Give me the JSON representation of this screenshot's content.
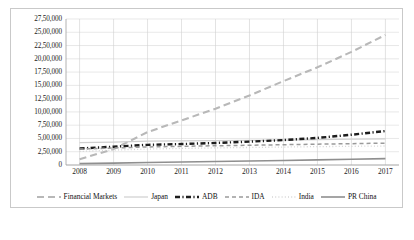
{
  "chart_data": {
    "type": "line",
    "title": "",
    "xlabel": "",
    "ylabel": "",
    "x": [
      2008,
      2009,
      2010,
      2011,
      2012,
      2013,
      2014,
      2015,
      2016,
      2017
    ],
    "xtick_labels": [
      "2008",
      "2009",
      "2010",
      "2011",
      "2012",
      "2013",
      "2014",
      "2015",
      "2016",
      "2017"
    ],
    "ytick_labels": [
      "0",
      "2,50,000",
      "5,00,000",
      "7,50,000",
      "10,00,000",
      "12,50,000",
      "15,00,000",
      "17,50,000",
      "20,00,000",
      "22,50,000",
      "25,00,000",
      "27,50,000"
    ],
    "ytick_values": [
      0,
      250000,
      500000,
      750000,
      1000000,
      1250000,
      1500000,
      1750000,
      2000000,
      2250000,
      2500000,
      2750000
    ],
    "ylim": [
      0,
      2750000
    ],
    "xlim": [
      2007.6,
      2017.4
    ],
    "grid": true,
    "legend_position": "bottom",
    "number_format": "indian",
    "series": [
      {
        "name": "Financial Markets",
        "style": "long-dash",
        "color": "#b8b8b8",
        "width": 2.1,
        "values": [
          110000,
          300000,
          620000,
          840000,
          1060000,
          1310000,
          1580000,
          1840000,
          2130000,
          2450000
        ]
      },
      {
        "name": "Japan",
        "style": "solid-thin",
        "color": "#cfcfcf",
        "width": 1.2,
        "values": [
          420000,
          430000,
          450000,
          455000,
          460000,
          465000,
          470000,
          478000,
          485000,
          492000
        ]
      },
      {
        "name": "ADB",
        "style": "dash-dot-bold",
        "color": "#1c1c1c",
        "width": 2.4,
        "values": [
          310000,
          345000,
          380000,
          395000,
          415000,
          440000,
          470000,
          510000,
          570000,
          640000
        ]
      },
      {
        "name": "IDA",
        "style": "dashed",
        "color": "#9a9a9a",
        "width": 1.5,
        "values": [
          300000,
          320000,
          340000,
          352000,
          362000,
          372000,
          382000,
          392000,
          402000,
          412000
        ]
      },
      {
        "name": "India",
        "style": "dotted",
        "color": "#d5d5d5",
        "width": 1.3,
        "values": [
          255000,
          280000,
          300000,
          312000,
          322000,
          330000,
          338000,
          346000,
          352000,
          358000
        ]
      },
      {
        "name": "PR China",
        "style": "solid",
        "color": "#8f8f8f",
        "width": 1.6,
        "values": [
          25000,
          35000,
          46000,
          56000,
          66000,
          76000,
          86000,
          96000,
          108000,
          120000
        ]
      }
    ]
  }
}
